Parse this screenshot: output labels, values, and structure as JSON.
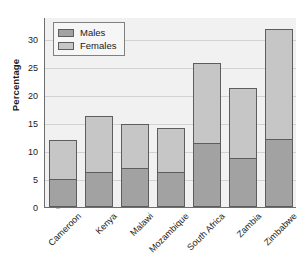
{
  "chart_data": {
    "type": "bar",
    "subtype": "stacked-bar",
    "title": "",
    "xlabel": "",
    "ylabel": "Percentage",
    "categories": [
      "Cameroon",
      "Kenya",
      "Malawi",
      "Mozambique",
      "South Africa",
      "Zambia",
      "Zimbabwe"
    ],
    "series": [
      {
        "name": "Males",
        "values": [
          5.0,
          6.2,
          6.9,
          6.2,
          11.5,
          8.8,
          12.2
        ],
        "color": "#a2a2a2"
      },
      {
        "name": "Females",
        "values": [
          7.2,
          10.3,
          8.2,
          8.1,
          14.4,
          12.7,
          19.8
        ],
        "color": "#c6c6c6"
      }
    ],
    "totals": [
      12.2,
      16.5,
      15.1,
      14.3,
      25.9,
      21.5,
      32.0
    ],
    "ylim": [
      0,
      34
    ],
    "yticks": [
      0,
      5,
      10,
      15,
      20,
      25,
      30
    ],
    "ytick_labels": [
      "0",
      "5",
      "10",
      "15",
      "20",
      "25",
      "30"
    ],
    "grid": true,
    "legend_position": "upper-left",
    "legend_entries": [
      "Males",
      "Females"
    ],
    "plot_background": "#f1f1f1",
    "gridline_color": "#d2d2d2",
    "axis_color": "#6e6e6e"
  }
}
